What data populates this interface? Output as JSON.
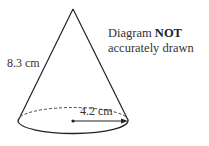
{
  "diagram": {
    "shape": "cone",
    "slant_height_label": "8.3 cm",
    "radius_label": "4.2 cm",
    "note": {
      "prefix": "Diagram ",
      "emphasis": "NOT",
      "line2": "accurately drawn"
    },
    "colors": {
      "stroke": "#222222",
      "text": "#333333"
    }
  }
}
